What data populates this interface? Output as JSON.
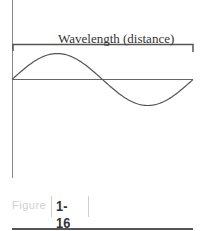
{
  "diagram": {
    "wavelength_label": "Wavelength (distance)",
    "wave": {
      "type": "sine",
      "cycles": 1,
      "starts_at": "baseline, rising"
    },
    "colors": {
      "line": "#555555",
      "text": "#333333",
      "figure_word": "#d0d0d0"
    }
  },
  "caption": {
    "figure_word": "Figure",
    "figure_number": "1-16"
  }
}
